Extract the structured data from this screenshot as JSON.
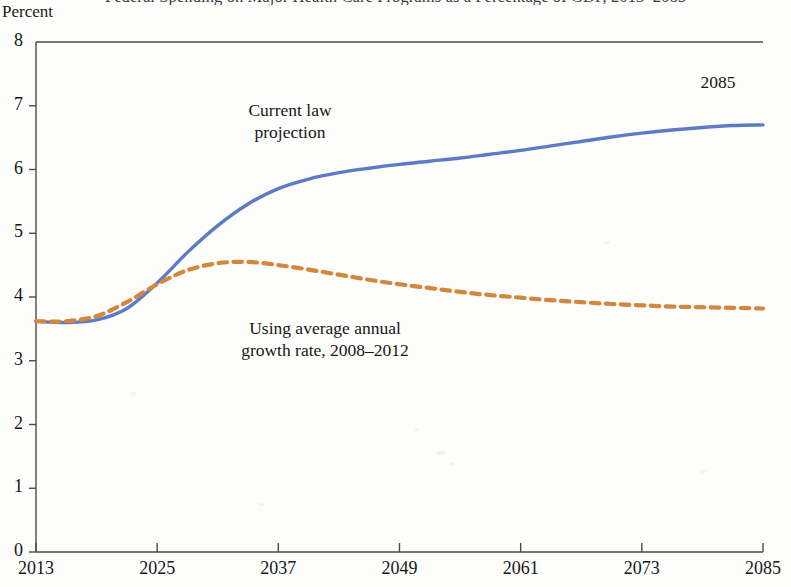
{
  "figure": {
    "unit_label": "Percent",
    "title_cropped": "Federal Spending on Major Health Care Programs as a Percentage of GDP, 2013–2085"
  },
  "annotations": {
    "current_law": "Current law\nprojection",
    "avg_growth": "Using average annual\ngrowth rate, 2008–2012",
    "endpoint_year": "2085"
  },
  "colors": {
    "current_law_line": "#5B7CC4",
    "avg_growth_line": "#D2873C",
    "axis": "#4a4a4a",
    "text": "#161616",
    "background": "#fdfdfc"
  },
  "chart_data": {
    "type": "line",
    "title": "",
    "xlabel": "",
    "ylabel": "Percent",
    "xlim": [
      2013,
      2085
    ],
    "ylim": [
      0,
      8
    ],
    "xticks": [
      2013,
      2025,
      2037,
      2049,
      2061,
      2073,
      2085
    ],
    "yticks": [
      0,
      1,
      2,
      3,
      4,
      5,
      6,
      7,
      8
    ],
    "grid": false,
    "legend": "inline-annotations",
    "series": [
      {
        "name": "Current law projection",
        "style": "solid",
        "color": "#5B7CC4",
        "x": [
          2013,
          2016,
          2019,
          2022,
          2025,
          2028,
          2031,
          2034,
          2037,
          2040,
          2043,
          2046,
          2049,
          2052,
          2055,
          2058,
          2061,
          2064,
          2067,
          2070,
          2073,
          2076,
          2079,
          2082,
          2085
        ],
        "values": [
          3.62,
          3.6,
          3.64,
          3.82,
          4.22,
          4.7,
          5.12,
          5.46,
          5.7,
          5.85,
          5.95,
          6.02,
          6.08,
          6.13,
          6.18,
          6.24,
          6.3,
          6.37,
          6.44,
          6.51,
          6.57,
          6.62,
          6.66,
          6.69,
          6.7
        ]
      },
      {
        "name": "Using average annual growth rate, 2008–2012",
        "style": "dashed",
        "color": "#D2873C",
        "x": [
          2013,
          2016,
          2019,
          2022,
          2025,
          2028,
          2031,
          2034,
          2037,
          2040,
          2043,
          2046,
          2049,
          2052,
          2055,
          2058,
          2061,
          2064,
          2067,
          2070,
          2073,
          2076,
          2079,
          2082,
          2085
        ],
        "values": [
          3.62,
          3.62,
          3.7,
          3.92,
          4.2,
          4.42,
          4.53,
          4.55,
          4.5,
          4.43,
          4.35,
          4.27,
          4.2,
          4.14,
          4.08,
          4.03,
          3.99,
          3.95,
          3.92,
          3.89,
          3.87,
          3.85,
          3.84,
          3.83,
          3.82
        ]
      }
    ]
  },
  "speckles": [
    {
      "x": 437,
      "y": 451,
      "w": 9,
      "h": 4
    },
    {
      "x": 449,
      "y": 462,
      "w": 6,
      "h": 3
    },
    {
      "x": 414,
      "y": 428,
      "w": 5,
      "h": 3
    },
    {
      "x": 258,
      "y": 503,
      "w": 7,
      "h": 3
    },
    {
      "x": 604,
      "y": 241,
      "w": 6,
      "h": 3
    },
    {
      "x": 131,
      "y": 392,
      "w": 5,
      "h": 3
    },
    {
      "x": 700,
      "y": 470,
      "w": 6,
      "h": 3
    },
    {
      "x": 330,
      "y": 268,
      "w": 5,
      "h": 2
    }
  ]
}
